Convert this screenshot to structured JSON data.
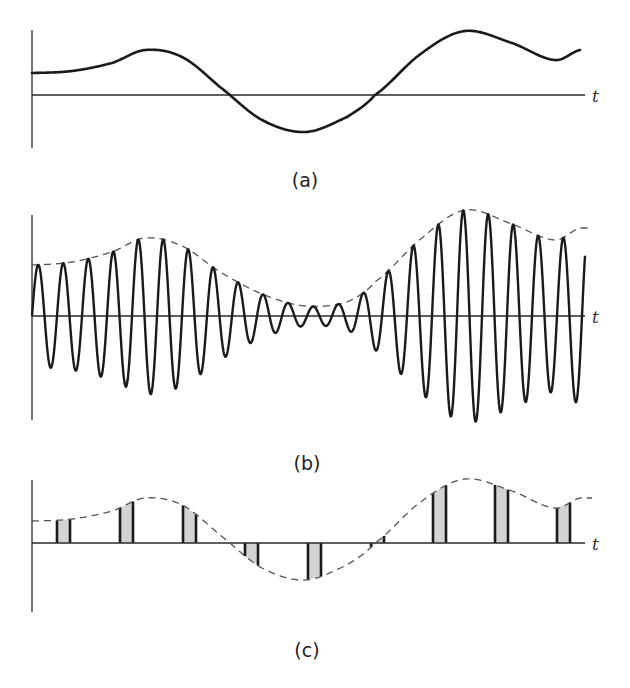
{
  "figure": {
    "panels": [
      {
        "id": "a",
        "label": "(a)",
        "axis_label": "t",
        "description": "message signal"
      },
      {
        "id": "b",
        "label": "(b)",
        "axis_label": "t",
        "description": "amplitude-modulated carrier with dashed envelope"
      },
      {
        "id": "c",
        "label": "(c)",
        "axis_label": "t",
        "description": "pulse-amplitude-modulated samples with dashed envelope"
      }
    ]
  },
  "chart_data": [
    {
      "type": "line",
      "title": "(a)",
      "xlabel": "t",
      "ylabel": "",
      "grid": false,
      "series": [
        {
          "name": "message",
          "style": "solid",
          "x": [
            0,
            40,
            80,
            113,
            150,
            188,
            230,
            273,
            315,
            343,
            390,
            433,
            480,
            523,
            548
          ],
          "y": [
            22,
            24,
            32,
            45,
            38,
            8,
            -25,
            -37,
            -22,
            0,
            42,
            64,
            52,
            35,
            45
          ]
        }
      ]
    },
    {
      "type": "line",
      "title": "(b)",
      "xlabel": "t",
      "grid": false,
      "carrier_period_px": 25,
      "series": [
        {
          "name": "envelope",
          "style": "dashed",
          "x": [
            0,
            40,
            80,
            113,
            150,
            188,
            230,
            273,
            315,
            343,
            390,
            433,
            480,
            523,
            548
          ],
          "y": [
            51,
            54,
            64,
            78,
            70,
            44,
            22,
            10,
            14,
            34,
            78,
            106,
            92,
            76,
            88
          ]
        },
        {
          "name": "modulated carrier",
          "style": "solid"
        }
      ]
    },
    {
      "type": "bar",
      "title": "(c)",
      "xlabel": "t",
      "grid": false,
      "pulse_width_px": 13,
      "pulse_starts_px": [
        25,
        88,
        151,
        213,
        276,
        339,
        401,
        463,
        525
      ],
      "series": [
        {
          "name": "envelope",
          "style": "dashed",
          "x": [
            0,
            40,
            80,
            113,
            150,
            188,
            230,
            273,
            315,
            343,
            390,
            433,
            480,
            523,
            548
          ],
          "y": [
            22,
            24,
            32,
            45,
            38,
            8,
            -25,
            -37,
            -22,
            0,
            42,
            64,
            52,
            35,
            45
          ]
        },
        {
          "name": "samples",
          "style": "shaded pulses"
        }
      ]
    }
  ]
}
